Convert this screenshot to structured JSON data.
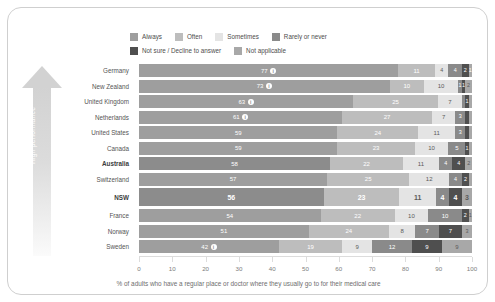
{
  "arrow": {
    "label": "High performance"
  },
  "legend": {
    "rows": [
      [
        {
          "label": "Always",
          "color": "#9e9e9e",
          "icon": "legend-swatch-always"
        },
        {
          "label": "Often",
          "color": "#bdbdbd",
          "icon": "legend-swatch-often"
        },
        {
          "label": "Sometimes",
          "color": "#e4e4e4",
          "icon": "legend-swatch-sometimes"
        },
        {
          "label": "Rarely or never",
          "color": "#8a8a8a",
          "icon": "legend-swatch-rarely-or-never"
        }
      ],
      [
        {
          "label": "Not sure / Decline to answer",
          "color": "#4f4f4f",
          "icon": "legend-swatch-not-sure"
        },
        {
          "label": "Not applicable",
          "color": "#a8a8a8",
          "icon": "legend-swatch-not-applicable"
        }
      ]
    ]
  },
  "colors": {
    "always": "#9e9e9e",
    "always_highlight": "#8c8c8c",
    "often": "#bdbdbd",
    "sometimes": "#e4e4e4",
    "rarely": "#8a8a8a",
    "not_sure": "#4f4f4f",
    "not_applicable": "#a8a8a8",
    "arrow": "#d2d2d2"
  },
  "axis": {
    "ticks": [
      "0",
      "10",
      "20",
      "30",
      "40",
      "50",
      "60",
      "70",
      "80",
      "90",
      "100"
    ],
    "min": 0,
    "max": 100
  },
  "caption": "% of adults who have a regular place or doctor where they usually go to for their medical care",
  "chart_data": {
    "type": "bar",
    "orientation": "horizontal",
    "stacked": true,
    "percent": true,
    "title": "",
    "subtitle": "",
    "xlabel": "% of adults who have a regular place or doctor where they usually go to for their medical care",
    "ylabel": "",
    "xlim": [
      0,
      100
    ],
    "xticks": [
      0,
      10,
      20,
      30,
      40,
      50,
      60,
      70,
      80,
      90,
      100
    ],
    "grid": false,
    "legend_position": "top",
    "annotation": "High performance",
    "series": [
      {
        "name": "Always",
        "color": "#9e9e9e",
        "values": [
          77,
          73,
          63,
          61,
          59,
          59,
          58,
          57,
          56,
          54,
          51,
          42
        ]
      },
      {
        "name": "Often",
        "color": "#bdbdbd",
        "values": [
          11,
          10,
          25,
          27,
          24,
          23,
          22,
          25,
          23,
          22,
          24,
          19
        ]
      },
      {
        "name": "Sometimes",
        "color": "#e4e4e4",
        "values": [
          4,
          10,
          7,
          7,
          11,
          10,
          11,
          12,
          11,
          10,
          8,
          9
        ]
      },
      {
        "name": "Rarely or never",
        "color": "#8a8a8a",
        "values": [
          4,
          1,
          1,
          3,
          3,
          5,
          4,
          4,
          4,
          10,
          7,
          12
        ]
      },
      {
        "name": "Not sure / Decline to answer",
        "color": "#4f4f4f",
        "values": [
          2,
          1,
          1,
          1,
          1,
          1,
          4,
          2,
          4,
          2,
          7,
          9
        ]
      },
      {
        "name": "Not applicable",
        "color": "#a8a8a8",
        "values": [
          1,
          2,
          1,
          1,
          1,
          1,
          2,
          1,
          3,
          1,
          3,
          9
        ]
      }
    ],
    "categories": [
      "Germany",
      "New Zealand",
      "United Kingdom",
      "Netherlands",
      "United States",
      "Canada",
      "Australia",
      "Switzerland",
      "NSW",
      "France",
      "Norway",
      "Sweden"
    ]
  },
  "rows": [
    {
      "cat": "Germany",
      "bold": false,
      "highlight": false,
      "info": true,
      "segs": [
        {
          "v": 77,
          "c": "#9e9e9e",
          "show": true,
          "lt": true
        },
        {
          "v": 11,
          "c": "#bdbdbd",
          "show": true,
          "lt": true
        },
        {
          "v": 4,
          "c": "#e4e4e4",
          "show": true,
          "lt": false
        },
        {
          "v": 4,
          "c": "#8a8a8a",
          "show": true,
          "lt": true
        },
        {
          "v": 2,
          "c": "#4f4f4f",
          "show": true,
          "lt": true
        },
        {
          "v": 1,
          "c": "#a8a8a8",
          "show": true,
          "lt": true
        }
      ]
    },
    {
      "cat": "New Zealand",
      "bold": false,
      "highlight": false,
      "info": true,
      "segs": [
        {
          "v": 73,
          "c": "#9e9e9e",
          "show": true,
          "lt": true
        },
        {
          "v": 10,
          "c": "#bdbdbd",
          "show": true,
          "lt": true
        },
        {
          "v": 10,
          "c": "#e4e4e4",
          "show": true,
          "lt": false
        },
        {
          "v": 1,
          "c": "#8a8a8a",
          "show": true,
          "lt": true
        },
        {
          "v": 1,
          "c": "#4f4f4f",
          "show": true,
          "lt": true
        },
        {
          "v": 2,
          "c": "#a8a8a8",
          "show": true,
          "lt": false
        }
      ]
    },
    {
      "cat": "United Kingdom",
      "bold": false,
      "highlight": false,
      "info": true,
      "segs": [
        {
          "v": 63,
          "c": "#9e9e9e",
          "show": true,
          "lt": true
        },
        {
          "v": 25,
          "c": "#bdbdbd",
          "show": true,
          "lt": true
        },
        {
          "v": 7,
          "c": "#e4e4e4",
          "show": true,
          "lt": false
        },
        {
          "v": 1,
          "c": "#8a8a8a",
          "show": false,
          "lt": true
        },
        {
          "v": 1,
          "c": "#4f4f4f",
          "show": true,
          "lt": true
        },
        {
          "v": 1,
          "c": "#a8a8a8",
          "show": false,
          "lt": true
        }
      ]
    },
    {
      "cat": "Netherlands",
      "bold": false,
      "highlight": false,
      "info": true,
      "segs": [
        {
          "v": 61,
          "c": "#9e9e9e",
          "show": true,
          "lt": true
        },
        {
          "v": 27,
          "c": "#bdbdbd",
          "show": true,
          "lt": true
        },
        {
          "v": 7,
          "c": "#e4e4e4",
          "show": true,
          "lt": false
        },
        {
          "v": 3,
          "c": "#8a8a8a",
          "show": true,
          "lt": true
        },
        {
          "v": 1,
          "c": "#4f4f4f",
          "show": false,
          "lt": true
        },
        {
          "v": 1,
          "c": "#a8a8a8",
          "show": false,
          "lt": true
        }
      ]
    },
    {
      "cat": "United States",
      "bold": false,
      "highlight": false,
      "info": false,
      "segs": [
        {
          "v": 59,
          "c": "#9e9e9e",
          "show": true,
          "lt": true
        },
        {
          "v": 24,
          "c": "#bdbdbd",
          "show": true,
          "lt": true
        },
        {
          "v": 11,
          "c": "#e4e4e4",
          "show": true,
          "lt": false
        },
        {
          "v": 3,
          "c": "#8a8a8a",
          "show": true,
          "lt": true
        },
        {
          "v": 1,
          "c": "#4f4f4f",
          "show": false,
          "lt": true
        },
        {
          "v": 1,
          "c": "#a8a8a8",
          "show": false,
          "lt": true
        }
      ]
    },
    {
      "cat": "Canada",
      "bold": false,
      "highlight": false,
      "info": false,
      "segs": [
        {
          "v": 59,
          "c": "#9e9e9e",
          "show": true,
          "lt": true
        },
        {
          "v": 23,
          "c": "#bdbdbd",
          "show": true,
          "lt": true
        },
        {
          "v": 10,
          "c": "#e4e4e4",
          "show": true,
          "lt": false
        },
        {
          "v": 5,
          "c": "#8a8a8a",
          "show": true,
          "lt": true
        },
        {
          "v": 1,
          "c": "#4f4f4f",
          "show": true,
          "lt": true
        },
        {
          "v": 1,
          "c": "#a8a8a8",
          "show": false,
          "lt": true
        }
      ]
    },
    {
      "cat": "Australia",
      "bold": true,
      "highlight": false,
      "info": false,
      "segs": [
        {
          "v": 58,
          "c": "#8c8c8c",
          "show": true,
          "lt": true
        },
        {
          "v": 22,
          "c": "#bdbdbd",
          "show": true,
          "lt": true
        },
        {
          "v": 11,
          "c": "#e4e4e4",
          "show": true,
          "lt": false
        },
        {
          "v": 4,
          "c": "#8a8a8a",
          "show": true,
          "lt": true
        },
        {
          "v": 4,
          "c": "#4f4f4f",
          "show": true,
          "lt": true
        },
        {
          "v": 2,
          "c": "#a8a8a8",
          "show": true,
          "lt": false
        }
      ]
    },
    {
      "cat": "Switzerland",
      "bold": false,
      "highlight": false,
      "info": false,
      "segs": [
        {
          "v": 57,
          "c": "#9e9e9e",
          "show": true,
          "lt": true
        },
        {
          "v": 25,
          "c": "#bdbdbd",
          "show": true,
          "lt": true
        },
        {
          "v": 12,
          "c": "#e4e4e4",
          "show": true,
          "lt": false
        },
        {
          "v": 4,
          "c": "#8a8a8a",
          "show": true,
          "lt": true
        },
        {
          "v": 2,
          "c": "#4f4f4f",
          "show": true,
          "lt": true
        },
        {
          "v": 1,
          "c": "#a8a8a8",
          "show": false,
          "lt": true
        }
      ]
    },
    {
      "cat": "NSW",
      "bold": true,
      "highlight": true,
      "info": false,
      "segs": [
        {
          "v": 56,
          "c": "#8c8c8c",
          "show": true,
          "lt": true
        },
        {
          "v": 23,
          "c": "#bdbdbd",
          "show": true,
          "lt": true
        },
        {
          "v": 11,
          "c": "#e4e4e4",
          "show": true,
          "lt": false
        },
        {
          "v": 4,
          "c": "#8a8a8a",
          "show": true,
          "lt": true
        },
        {
          "v": 4,
          "c": "#4f4f4f",
          "show": true,
          "lt": true
        },
        {
          "v": 3,
          "c": "#a8a8a8",
          "show": true,
          "lt": false
        }
      ]
    },
    {
      "cat": "France",
      "bold": false,
      "highlight": false,
      "info": false,
      "segs": [
        {
          "v": 54,
          "c": "#9e9e9e",
          "show": true,
          "lt": true
        },
        {
          "v": 22,
          "c": "#bdbdbd",
          "show": true,
          "lt": true
        },
        {
          "v": 10,
          "c": "#e4e4e4",
          "show": true,
          "lt": false
        },
        {
          "v": 10,
          "c": "#8a8a8a",
          "show": true,
          "lt": true
        },
        {
          "v": 2,
          "c": "#4f4f4f",
          "show": true,
          "lt": true
        },
        {
          "v": 1,
          "c": "#a8a8a8",
          "show": true,
          "lt": false
        }
      ]
    },
    {
      "cat": "Norway",
      "bold": false,
      "highlight": false,
      "info": false,
      "segs": [
        {
          "v": 51,
          "c": "#9e9e9e",
          "show": true,
          "lt": true
        },
        {
          "v": 24,
          "c": "#bdbdbd",
          "show": true,
          "lt": true
        },
        {
          "v": 8,
          "c": "#e4e4e4",
          "show": true,
          "lt": false
        },
        {
          "v": 7,
          "c": "#8a8a8a",
          "show": true,
          "lt": true
        },
        {
          "v": 7,
          "c": "#4f4f4f",
          "show": true,
          "lt": true
        },
        {
          "v": 3,
          "c": "#a8a8a8",
          "show": true,
          "lt": false
        }
      ]
    },
    {
      "cat": "Sweden",
      "bold": false,
      "highlight": false,
      "info": true,
      "segs": [
        {
          "v": 42,
          "c": "#9e9e9e",
          "show": true,
          "lt": true
        },
        {
          "v": 19,
          "c": "#bdbdbd",
          "show": true,
          "lt": true
        },
        {
          "v": 9,
          "c": "#e4e4e4",
          "show": true,
          "lt": false
        },
        {
          "v": 12,
          "c": "#8a8a8a",
          "show": true,
          "lt": true
        },
        {
          "v": 9,
          "c": "#4f4f4f",
          "show": true,
          "lt": true
        },
        {
          "v": 9,
          "c": "#a8a8a8",
          "show": true,
          "lt": false
        }
      ]
    }
  ]
}
